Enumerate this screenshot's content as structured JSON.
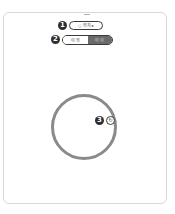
{
  "markers": [
    "1",
    "2",
    "3"
  ],
  "pill": {
    "icon": "○",
    "label": "위치",
    "arrow": "▸"
  },
  "toggle": {
    "left_label": "이 위",
    "right_label": "아 이"
  },
  "circle_button": {
    "icon": "↻"
  },
  "colors": {
    "marker": "#2e2e2e",
    "circle": "#8a8a8a",
    "toggle_off": "#6a6a6a"
  }
}
